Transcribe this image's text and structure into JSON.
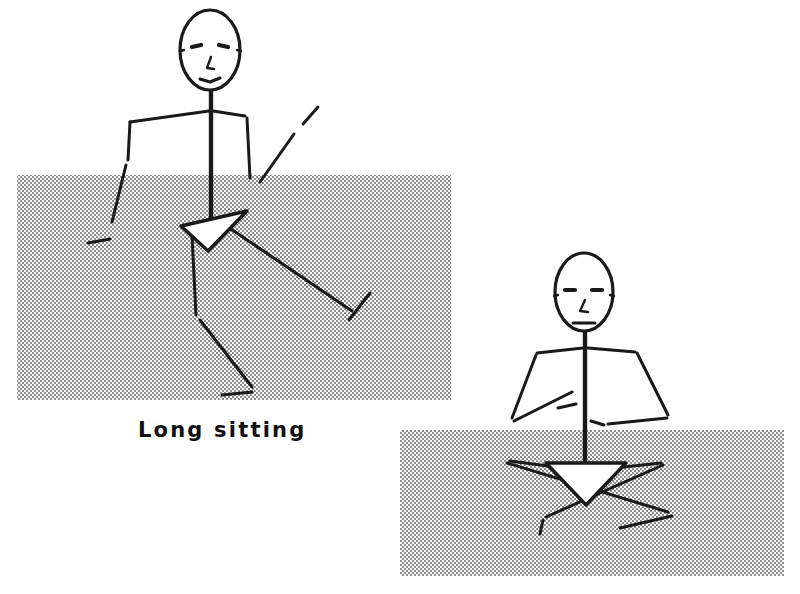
{
  "document": {
    "type": "line-drawing-illustration",
    "background_color": "#ffffff",
    "ink_color": "#1a1a1a",
    "width": 800,
    "height": 594
  },
  "captions": [
    {
      "text": "Long sitting",
      "x": 138,
      "y": 419,
      "font_size": 21,
      "letter_spacing": 2.2,
      "bold": true,
      "color": "#111111"
    }
  ],
  "shaded_panels": [
    {
      "name": "floor-panel-left",
      "x": 17,
      "y": 175,
      "width": 434,
      "height": 225,
      "fill_style": "halftone-dots",
      "dot_color": "#5a5a5a",
      "dot_spacing": 4,
      "dot_radius": 0.95
    },
    {
      "name": "floor-panel-right",
      "x": 400,
      "y": 430,
      "width": 384,
      "height": 146,
      "fill_style": "halftone-dots",
      "dot_color": "#5a5a5a",
      "dot_spacing": 4,
      "dot_radius": 0.95
    }
  ],
  "figures": [
    {
      "name": "figure-long-sitting",
      "label": "Long sitting",
      "posture": "long sitting, legs extended forward, hands resting behind",
      "head": {
        "cx": 210,
        "cy": 50,
        "rx": 30,
        "ry": 40,
        "stroke_width": 3.2
      },
      "face": {
        "eye_left": {
          "x1": 192,
          "y1": 47,
          "x2": 201,
          "y2": 45
        },
        "eye_right": {
          "x1": 219,
          "y1": 45,
          "x2": 228,
          "y2": 47
        },
        "nose": {
          "points": "211,57 207,68 214,69"
        },
        "mouth": {
          "points": "200,79 210,82 220,78"
        },
        "ear_left": {
          "x1": 180,
          "y1": 51,
          "x2": 184,
          "y2": 50
        },
        "ear_right": {
          "x1": 237,
          "y1": 50,
          "x2": 241,
          "y2": 51
        }
      },
      "trunk": {
        "name": "spine",
        "x1": 211,
        "y1": 90,
        "x2": 211,
        "y2": 218,
        "stroke_width": 4.4
      },
      "strokes": [
        {
          "name": "shoulder-line-left",
          "points": "130,122 209,111",
          "width": 3.0
        },
        {
          "name": "shoulder-line-right",
          "points": "213,111 245,116",
          "width": 3.0
        },
        {
          "name": "upper-arm-left",
          "points": "130,122 128,160",
          "width": 3.0
        },
        {
          "name": "forearm-left",
          "points": "126,165 112,222",
          "width": 3.0
        },
        {
          "name": "hand-left",
          "points": "88,243 110,239",
          "width": 3.0
        },
        {
          "name": "upper-arm-right",
          "points": "247,118 250,178",
          "width": 3.0
        },
        {
          "name": "forearm-right",
          "points": "260,182 294,134",
          "width": 3.0
        },
        {
          "name": "hand-right",
          "points": "303,124 318,107",
          "width": 3.0
        },
        {
          "name": "thigh-near",
          "points": "228,227 352,311",
          "width": 3.0
        },
        {
          "name": "shin-near",
          "points": "349,320 370,293",
          "width": 3.0
        },
        {
          "name": "thigh-far",
          "points": "192,235 196,315",
          "width": 3.0
        },
        {
          "name": "shin-far",
          "points": "200,320 252,387",
          "width": 3.0
        },
        {
          "name": "foot-far",
          "points": "222,395 252,392",
          "width": 3.0
        }
      ],
      "pelvis_triangle": {
        "name": "pelvis-arrowhead",
        "points": "181,226 247,211 208,251",
        "fill": "#ffffff",
        "stroke_width": 3.4
      }
    },
    {
      "name": "figure-cross-legged-sitting",
      "label": "",
      "posture": "cross-legged sitting, arms down and out to sides",
      "head": {
        "cx": 584,
        "cy": 292,
        "rx": 29,
        "ry": 39,
        "stroke_width": 3.2
      },
      "face": {
        "eye_left": {
          "x1": 565,
          "y1": 290,
          "x2": 575,
          "y2": 290
        },
        "eye_right": {
          "x1": 592,
          "y1": 290,
          "x2": 602,
          "y2": 290
        },
        "nose": {
          "points": "585,300 580,311 588,312"
        },
        "mouth": {
          "points": "573,323 595,323"
        },
        "ear_left": {
          "x1": 554,
          "y1": 296,
          "x2": 558,
          "y2": 295
        },
        "ear_right": {
          "x1": 610,
          "y1": 295,
          "x2": 614,
          "y2": 296
        }
      },
      "trunk": {
        "name": "spine",
        "x1": 585,
        "y1": 331,
        "x2": 585,
        "y2": 462,
        "stroke_width": 4.4
      },
      "strokes": [
        {
          "name": "shoulder-line-left",
          "points": "537,353 583,348",
          "width": 3.0
        },
        {
          "name": "shoulder-line-right",
          "points": "588,348 635,352",
          "width": 3.0
        },
        {
          "name": "arm-outer-left",
          "points": "536,355 512,418",
          "width": 3.0
        },
        {
          "name": "arm-inner-left",
          "points": "514,421 572,392",
          "width": 3.0
        },
        {
          "name": "hand-left",
          "points": "558,408 576,404",
          "width": 3.0
        },
        {
          "name": "arm-outer-right",
          "points": "637,353 668,415",
          "width": 3.0
        },
        {
          "name": "arm-inner-right",
          "points": "667,418 608,424",
          "width": 3.0
        },
        {
          "name": "hand-right",
          "points": "591,421 604,425",
          "width": 3.0
        },
        {
          "name": "leg-cross-a-upper",
          "points": "507,463 668,512",
          "width": 3.0
        },
        {
          "name": "leg-cross-a-lower",
          "points": "672,516 620,528",
          "width": 3.0
        },
        {
          "name": "leg-cross-b-upper",
          "points": "663,465 546,517",
          "width": 3.0
        },
        {
          "name": "leg-cross-b-lower",
          "points": "543,520 540,534",
          "width": 3.0
        },
        {
          "name": "knee-line-left",
          "points": "510,461 578,470",
          "width": 3.0
        },
        {
          "name": "knee-line-right",
          "points": "596,470 661,463",
          "width": 3.0
        }
      ],
      "pelvis_triangle": {
        "name": "pelvis-arrowhead",
        "points": "546,463 626,463 586,505",
        "fill": "#ffffff",
        "stroke_width": 3.4
      }
    }
  ]
}
